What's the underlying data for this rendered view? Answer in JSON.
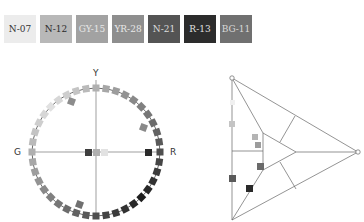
{
  "swatches": [
    {
      "label": "N-07",
      "bg": "#ececec",
      "fg": "#333333"
    },
    {
      "label": "N-12",
      "bg": "#b8b8b8",
      "fg": "#2a2a2a"
    },
    {
      "label": "GY-15",
      "bg": "#a2a2a2",
      "fg": "#e6e6e6"
    },
    {
      "label": "YR-28",
      "bg": "#8e8e8e",
      "fg": "#e8e8e8"
    },
    {
      "label": "N-21",
      "bg": "#545454",
      "fg": "#dddddd"
    },
    {
      "label": "R-13",
      "bg": "#2c2c2c",
      "fg": "#e0e0e0"
    },
    {
      "label": "BG-11",
      "bg": "#707070",
      "fg": "#d8d8d8"
    }
  ],
  "hue_circle": {
    "axis_labels": {
      "top": "Y",
      "left": "G",
      "right": "R"
    },
    "center": [
      96,
      152
    ],
    "radius": 64
  },
  "triangle": {
    "vertices": {
      "top": [
        232,
        78
      ],
      "right": [
        358,
        152
      ],
      "bottom": [
        232,
        220
      ]
    }
  }
}
